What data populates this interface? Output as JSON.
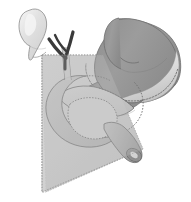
{
  "figure": {
    "title": "Stomach, duodenum and biliary tract with sectional plane",
    "view": "anterior oblique",
    "background_color": "#ffffff",
    "width": 191,
    "height": 202
  },
  "palette": {
    "stomach_body": "#9a9a9a",
    "stomach_shadow": "#8a8a8a",
    "stomach_highlight": "#d9d9d9",
    "greater_curvature_band": "#e2e2e2",
    "plane_fill": "#c6c6c6",
    "plane_edge": "#a0a0a0",
    "pancreas": "#c3c3c3",
    "duodenum": "#b8b8b8",
    "duodenum_stump": "#b0b0b0",
    "lumen": "#8f8f8f",
    "gallbladder": "#dcdcdc",
    "gallbladder_highlight": "#f2f2f2",
    "bile_duct": "#3a3a3a",
    "outline": "#707070",
    "dotted_line": "#6f6f6f"
  },
  "structures": [
    {
      "id": "gallbladder",
      "label": "Gallbladder",
      "region": "upper-left",
      "shape": "pear",
      "fill": "#dcdcdc",
      "has_specular_highlight": true
    },
    {
      "id": "cystic-duct",
      "label": "Cystic duct",
      "region": "upper-left",
      "shape": "tube",
      "fill": "#3a3a3a"
    },
    {
      "id": "common-hepatic-duct",
      "label": "Common hepatic duct",
      "region": "upper-center",
      "shape": "tube",
      "fill": "#3a3a3a"
    },
    {
      "id": "common-bile-duct",
      "label": "Common bile duct",
      "region": "center-left",
      "shape": "tube",
      "fill": "#b8b8b8"
    },
    {
      "id": "stomach",
      "label": "Stomach",
      "region": "right",
      "shape": "J-curve",
      "fill": "#9a9a9a",
      "parts": [
        "fundus",
        "cardia",
        "body",
        "greater curvature",
        "lesser curvature",
        "antrum",
        "pylorus"
      ]
    },
    {
      "id": "duodenum",
      "label": "Duodenum",
      "region": "center-lower",
      "shape": "C-loop",
      "fill": "#b8b8b8"
    },
    {
      "id": "duodenal-stump",
      "label": "Transected duodenal stump",
      "region": "lower-center-right",
      "shape": "cut tube with open lumen",
      "fill": "#b0b0b0"
    },
    {
      "id": "pancreas",
      "label": "Pancreas",
      "region": "center",
      "shape": "elongated lobe",
      "fill": "#c3c3c3"
    },
    {
      "id": "sectional-plane",
      "label": "Translucent sectional plane",
      "region": "left",
      "shape": "quadrilateral sheet",
      "fill": "#c6c6c6",
      "edge_style": "dotted"
    },
    {
      "id": "resection-line",
      "label": "Dotted resection outline",
      "region": "across stomach and duodenum",
      "shape": "dotted contour",
      "stroke": "#6f6f6f"
    }
  ],
  "annotations": {
    "dotted_lines_meaning": "hidden or resected margins",
    "plane_meaning": "cut plane through retroperitoneum"
  }
}
